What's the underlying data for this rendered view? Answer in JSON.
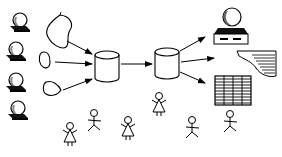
{
  "diagram": {
    "title": "",
    "background": "#ffffff",
    "stroke_color": "#000000",
    "sources": [
      {
        "id": "user-1",
        "icon": "user-terminal-icon",
        "x": 20,
        "y": 22
      },
      {
        "id": "user-2",
        "icon": "user-terminal-icon",
        "x": 14,
        "y": 50
      },
      {
        "id": "user-3",
        "icon": "user-terminal-icon",
        "x": 14,
        "y": 80
      },
      {
        "id": "user-4",
        "icon": "user-terminal-icon",
        "x": 16,
        "y": 108
      }
    ],
    "data_blobs": [
      {
        "id": "blob-1",
        "icon": "data-blob-icon"
      },
      {
        "id": "blob-2",
        "icon": "data-blob-icon"
      },
      {
        "id": "blob-3",
        "icon": "data-blob-icon"
      }
    ],
    "stores": [
      {
        "id": "database-1",
        "icon": "database-cylinder-icon",
        "x": 95,
        "y": 50
      },
      {
        "id": "database-2",
        "icon": "database-cylinder-icon",
        "x": 158,
        "y": 47
      }
    ],
    "outputs": [
      {
        "id": "workstation",
        "icon": "computer-workstation-icon"
      },
      {
        "id": "report",
        "icon": "printed-report-icon"
      },
      {
        "id": "spreadsheet",
        "icon": "spreadsheet-grid-icon"
      }
    ],
    "people": [
      {
        "id": "person-1",
        "icon": "woman-stick-figure-icon",
        "x": 70,
        "y": 128
      },
      {
        "id": "person-2",
        "icon": "man-stick-figure-icon",
        "x": 94,
        "y": 115
      },
      {
        "id": "person-3",
        "icon": "woman-stick-figure-icon",
        "x": 128,
        "y": 122
      },
      {
        "id": "person-4",
        "icon": "woman-stick-figure-icon",
        "x": 160,
        "y": 98
      },
      {
        "id": "person-5",
        "icon": "man-stick-figure-icon",
        "x": 191,
        "y": 125
      },
      {
        "id": "person-6",
        "icon": "man-stick-figure-icon",
        "x": 229,
        "y": 115
      }
    ]
  }
}
